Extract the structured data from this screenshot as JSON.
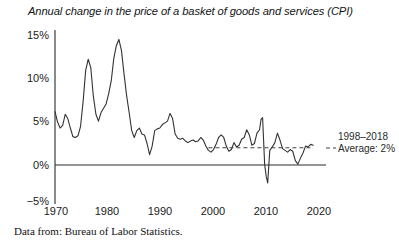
{
  "chart_data": {
    "type": "line",
    "title": "Annual change in the price of a basket of goods and services (CPI)",
    "xlabel": "",
    "ylabel": "",
    "xlim": [
      1968,
      2021
    ],
    "ylim": [
      -5,
      15
    ],
    "grid": false,
    "legend": "none",
    "source_note": "Data from: Bureau of Labor Statistics.",
    "xticks": [
      "1970",
      "1980",
      "1990",
      "2000",
      "2010",
      "2020"
    ],
    "xtick_values": [
      1970,
      1980,
      1990,
      2000,
      2010,
      2020
    ],
    "yticks": [
      "15%",
      "10%",
      "5%",
      "0%",
      "−5%"
    ],
    "ytick_values": [
      15,
      10,
      5,
      0,
      -5
    ],
    "series": [
      {
        "name": "CPI annual change",
        "color": "#333333",
        "x": [
          1968,
          1968.5,
          1969,
          1969.5,
          1970,
          1970.5,
          1971,
          1971.5,
          1972,
          1972.5,
          1973,
          1973.5,
          1974,
          1974.5,
          1975,
          1975.5,
          1976,
          1976.5,
          1977,
          1977.5,
          1978,
          1978.5,
          1979,
          1979.5,
          1980,
          1980.5,
          1981,
          1981.5,
          1982,
          1982.5,
          1983,
          1983.5,
          1984,
          1984.5,
          1985,
          1985.5,
          1986,
          1986.5,
          1987,
          1987.5,
          1988,
          1988.5,
          1989,
          1989.5,
          1990,
          1990.5,
          1991,
          1991.5,
          1992,
          1992.5,
          1993,
          1993.5,
          1994,
          1994.5,
          1995,
          1995.5,
          1996,
          1996.5,
          1997,
          1997.5,
          1998,
          1998.5,
          1999,
          1999.5,
          2000,
          2000.5,
          2001,
          2001.5,
          2002,
          2002.5,
          2003,
          2003.5,
          2004,
          2004.5,
          2005,
          2005.5,
          2006,
          2006.5,
          2007,
          2007.5,
          2008,
          2008.3,
          2008.6,
          2009,
          2009.3,
          2009.6,
          2010,
          2010.5,
          2011,
          2011.5,
          2012,
          2012.5,
          2013,
          2013.5,
          2014,
          2014.5,
          2015,
          2015.5,
          2016,
          2016.5,
          2017,
          2017.5,
          2018,
          2018.5
        ],
        "y": [
          6.2,
          5.0,
          4.3,
          4.6,
          5.9,
          5.4,
          4.3,
          3.3,
          3.2,
          3.4,
          4.5,
          7.4,
          11.0,
          12.3,
          11.3,
          8.0,
          5.9,
          5.1,
          6.1,
          6.6,
          7.1,
          8.3,
          9.8,
          12.4,
          13.9,
          14.6,
          13.3,
          10.6,
          8.1,
          6.1,
          4.0,
          3.2,
          4.0,
          4.3,
          3.6,
          3.5,
          2.5,
          1.2,
          2.2,
          4.0,
          4.2,
          4.3,
          4.7,
          4.9,
          5.1,
          6.0,
          5.4,
          3.6,
          3.1,
          3.0,
          3.1,
          2.8,
          2.6,
          2.8,
          2.9,
          2.7,
          2.8,
          3.2,
          2.9,
          2.2,
          1.7,
          1.5,
          1.8,
          2.4,
          3.2,
          3.5,
          3.2,
          2.2,
          1.6,
          1.8,
          2.6,
          2.1,
          2.3,
          3.0,
          3.2,
          4.1,
          3.5,
          2.3,
          2.5,
          3.7,
          4.1,
          5.3,
          5.5,
          0.1,
          -1.3,
          -2.1,
          1.7,
          2.1,
          2.6,
          3.7,
          2.9,
          1.9,
          1.7,
          1.5,
          1.8,
          1.6,
          0.5,
          0.1,
          0.8,
          1.4,
          2.2,
          2.1,
          2.4,
          2.3
        ]
      }
    ],
    "reference_line": {
      "label_line1": "1998–2018",
      "label_line2": "Average: 2%",
      "value": 2,
      "x_start": 1998,
      "x_end": 2018.5,
      "style": "dashed",
      "color": "#444444"
    },
    "axes": {
      "zero_line": true,
      "zero_line_value": 0,
      "y_axis_visible": true,
      "x_axis_spine": "zero"
    }
  }
}
